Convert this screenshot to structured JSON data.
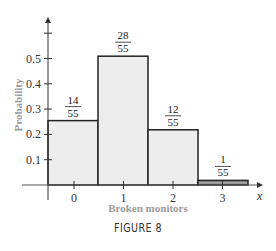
{
  "chart_data": {
    "type": "bar",
    "title": "",
    "xlabel": "Broken monitors",
    "ylabel": "Probability",
    "x_axis_symbol": "x",
    "categories": [
      "0",
      "1",
      "2",
      "3"
    ],
    "values": [
      0.2545,
      0.5091,
      0.2182,
      0.0182
    ],
    "value_labels": [
      {
        "num": "14",
        "den": "55"
      },
      {
        "num": "28",
        "den": "55"
      },
      {
        "num": "12",
        "den": "55"
      },
      {
        "num": "1",
        "den": "55"
      }
    ],
    "yticks": [
      "0.1",
      "0.2",
      "0.3",
      "0.4",
      "0.5"
    ],
    "ylim": [
      0,
      0.65
    ],
    "grid": false,
    "legend": null
  },
  "caption": "FIGURE 8"
}
